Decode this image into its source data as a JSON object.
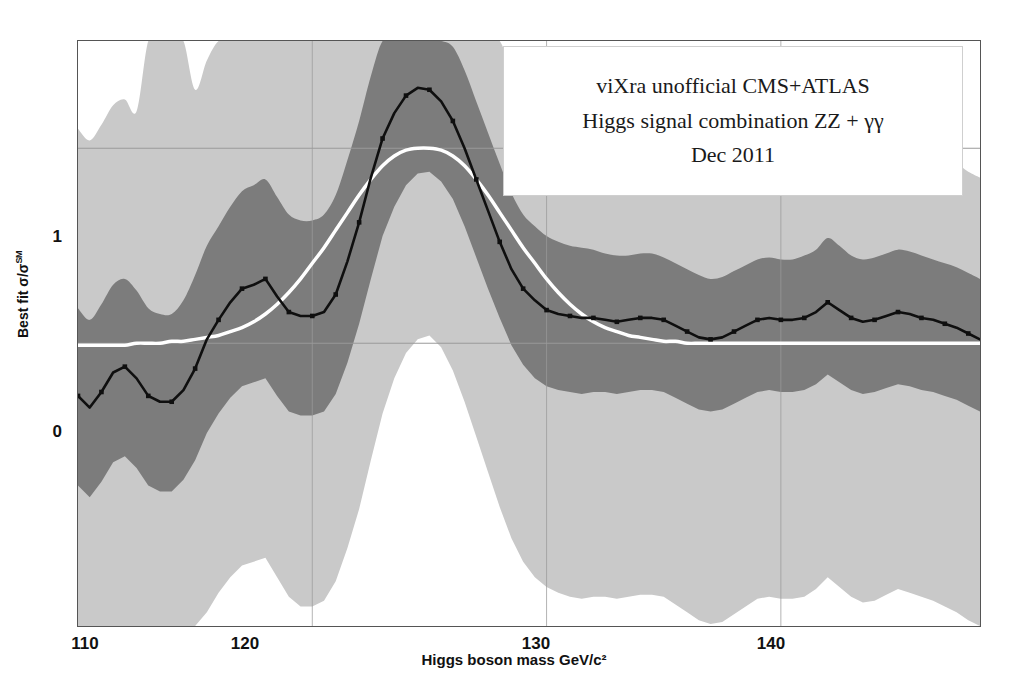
{
  "figure": {
    "background": "#ffffff",
    "frame_color": "#555555"
  },
  "legend": {
    "line1": "viXra unofficial CMS+ATLAS",
    "line2": "Higgs signal combination ZZ + γγ",
    "line3": "Dec 2011"
  },
  "axes": {
    "x_title": "Higgs boson mass GeV/c²",
    "y_title_prefix": "Best fit σ/σ",
    "y_title_sup": "SM",
    "x_ticks": [
      "110",
      "120",
      "130",
      "140"
    ],
    "y_ticks": [
      "1",
      "0"
    ]
  },
  "colors": {
    "band_2sigma": "#c9c9c9",
    "band_1sigma": "#7c7c7c",
    "best_fit_line": "#0f0f0f",
    "expected_curve": "#ffffff",
    "gridline": "#9a9a9a",
    "axis_text": "#111111"
  },
  "chart_data": {
    "type": "line",
    "subtitle": "Dec 2011",
    "xlabel": "Higgs boson mass GeV/c²",
    "ylabel": "Best fit σ/σSM",
    "xlim": [
      110,
      148.5
    ],
    "ylim": [
      -1.45,
      1.55
    ],
    "xticks": [
      110,
      120,
      130,
      140
    ],
    "yticks": [
      0,
      1
    ],
    "grid": "gridlines at y=0, y=1 and x=110,120,130,140",
    "legend_position": "top-right inside plot",
    "x": [
      110.0,
      110.5,
      111.0,
      111.5,
      112.0,
      112.5,
      113.0,
      113.5,
      114.0,
      114.5,
      115.0,
      115.5,
      116.0,
      116.5,
      117.0,
      117.5,
      118.0,
      118.5,
      119.0,
      119.5,
      120.0,
      120.5,
      121.0,
      121.5,
      122.0,
      122.5,
      123.0,
      123.5,
      124.0,
      124.5,
      125.0,
      125.5,
      126.0,
      126.5,
      127.0,
      127.5,
      128.0,
      128.5,
      129.0,
      129.5,
      130.0,
      130.5,
      131.0,
      131.5,
      132.0,
      132.5,
      133.0,
      133.5,
      134.0,
      134.5,
      135.0,
      135.5,
      136.0,
      136.5,
      137.0,
      137.5,
      138.0,
      138.5,
      139.0,
      139.5,
      140.0,
      140.5,
      141.0,
      141.5,
      142.0,
      142.5,
      143.0,
      143.5,
      144.0,
      144.5,
      145.0,
      145.5,
      146.0,
      146.5,
      147.0,
      147.5,
      148.0,
      148.5
    ],
    "series": [
      {
        "name": "Best fit σ/σSM (observed)",
        "style": "black line with square markers",
        "values": [
          -0.27,
          -0.33,
          -0.25,
          -0.15,
          -0.12,
          -0.18,
          -0.27,
          -0.3,
          -0.3,
          -0.24,
          -0.13,
          0.02,
          0.12,
          0.21,
          0.28,
          0.3,
          0.33,
          0.24,
          0.16,
          0.14,
          0.14,
          0.16,
          0.25,
          0.42,
          0.62,
          0.85,
          1.05,
          1.18,
          1.27,
          1.31,
          1.3,
          1.24,
          1.14,
          1.0,
          0.84,
          0.68,
          0.52,
          0.38,
          0.28,
          0.22,
          0.17,
          0.15,
          0.14,
          0.13,
          0.13,
          0.12,
          0.11,
          0.12,
          0.13,
          0.13,
          0.12,
          0.09,
          0.06,
          0.03,
          0.02,
          0.03,
          0.06,
          0.09,
          0.12,
          0.13,
          0.12,
          0.12,
          0.13,
          0.16,
          0.21,
          0.17,
          0.13,
          0.11,
          0.12,
          0.14,
          0.16,
          0.15,
          0.13,
          0.12,
          0.1,
          0.08,
          0.05,
          0.02
        ]
      },
      {
        "name": "Expected Standard Model signal",
        "style": "smooth white curve",
        "values": [
          -0.01,
          -0.01,
          -0.01,
          -0.01,
          -0.01,
          0.0,
          0.0,
          0.0,
          0.01,
          0.01,
          0.02,
          0.03,
          0.04,
          0.06,
          0.08,
          0.11,
          0.15,
          0.2,
          0.26,
          0.33,
          0.41,
          0.49,
          0.58,
          0.67,
          0.76,
          0.84,
          0.91,
          0.96,
          0.99,
          1.0,
          1.0,
          0.99,
          0.96,
          0.91,
          0.84,
          0.76,
          0.67,
          0.58,
          0.49,
          0.41,
          0.33,
          0.26,
          0.2,
          0.15,
          0.11,
          0.08,
          0.06,
          0.04,
          0.03,
          0.02,
          0.01,
          0.01,
          0.0,
          0.0,
          0.0,
          0.0,
          0.0,
          0.0,
          0.0,
          0.0,
          0.0,
          0.0,
          0.0,
          0.0,
          0.0,
          0.0,
          0.0,
          0.0,
          0.0,
          0.0,
          0.0,
          0.0,
          0.0,
          0.0,
          0.0,
          0.0,
          0.0,
          0.0
        ]
      }
    ],
    "bands": [
      {
        "name": "1 sigma band",
        "color": "#7c7c7c",
        "upper": [
          0.18,
          0.12,
          0.2,
          0.3,
          0.33,
          0.27,
          0.18,
          0.15,
          0.15,
          0.22,
          0.35,
          0.5,
          0.6,
          0.7,
          0.78,
          0.81,
          0.84,
          0.75,
          0.66,
          0.63,
          0.63,
          0.66,
          0.76,
          0.94,
          1.14,
          1.37,
          1.55,
          1.55,
          1.55,
          1.55,
          1.55,
          1.55,
          1.52,
          1.4,
          1.24,
          1.08,
          0.92,
          0.77,
          0.66,
          0.6,
          0.55,
          0.52,
          0.5,
          0.49,
          0.48,
          0.46,
          0.45,
          0.45,
          0.46,
          0.46,
          0.44,
          0.41,
          0.38,
          0.35,
          0.33,
          0.34,
          0.37,
          0.4,
          0.43,
          0.44,
          0.43,
          0.43,
          0.45,
          0.48,
          0.54,
          0.5,
          0.45,
          0.43,
          0.44,
          0.46,
          0.48,
          0.47,
          0.45,
          0.43,
          0.41,
          0.39,
          0.36,
          0.33
        ],
        "lower": [
          -0.73,
          -0.79,
          -0.71,
          -0.61,
          -0.58,
          -0.64,
          -0.73,
          -0.76,
          -0.76,
          -0.7,
          -0.6,
          -0.46,
          -0.36,
          -0.28,
          -0.22,
          -0.2,
          -0.18,
          -0.27,
          -0.35,
          -0.37,
          -0.37,
          -0.35,
          -0.26,
          -0.1,
          0.1,
          0.33,
          0.55,
          0.7,
          0.81,
          0.87,
          0.88,
          0.83,
          0.74,
          0.6,
          0.44,
          0.28,
          0.13,
          -0.01,
          -0.11,
          -0.18,
          -0.22,
          -0.24,
          -0.25,
          -0.26,
          -0.25,
          -0.25,
          -0.26,
          -0.25,
          -0.24,
          -0.24,
          -0.25,
          -0.28,
          -0.31,
          -0.34,
          -0.35,
          -0.34,
          -0.31,
          -0.28,
          -0.25,
          -0.24,
          -0.25,
          -0.25,
          -0.24,
          -0.21,
          -0.16,
          -0.2,
          -0.24,
          -0.26,
          -0.25,
          -0.23,
          -0.21,
          -0.22,
          -0.24,
          -0.25,
          -0.27,
          -0.29,
          -0.32,
          -0.35
        ]
      },
      {
        "name": "2 sigma band",
        "color": "#c9c9c9",
        "upper": [
          1.1,
          1.04,
          1.12,
          1.22,
          1.25,
          1.19,
          1.55,
          1.55,
          1.55,
          1.55,
          1.3,
          1.45,
          1.55,
          1.55,
          1.55,
          1.55,
          1.55,
          1.55,
          1.55,
          1.55,
          1.55,
          1.55,
          1.55,
          1.55,
          1.55,
          1.55,
          1.55,
          1.55,
          1.55,
          1.55,
          1.55,
          1.55,
          1.55,
          1.55,
          1.55,
          1.55,
          1.55,
          1.4,
          1.25,
          1.18,
          1.12,
          1.08,
          1.06,
          1.04,
          1.02,
          1.0,
          0.99,
          0.99,
          1.0,
          1.0,
          0.98,
          0.94,
          0.9,
          0.86,
          0.84,
          0.85,
          0.89,
          0.93,
          0.97,
          0.98,
          0.97,
          0.97,
          0.99,
          1.03,
          1.09,
          1.04,
          0.99,
          0.96,
          0.97,
          1.0,
          1.02,
          1.01,
          0.99,
          0.97,
          0.94,
          0.92,
          0.88,
          0.85
        ],
        "lower": [
          -1.45,
          -1.45,
          -1.45,
          -1.45,
          -1.45,
          -1.45,
          -1.45,
          -1.45,
          -1.45,
          -1.45,
          -1.45,
          -1.38,
          -1.28,
          -1.2,
          -1.14,
          -1.12,
          -1.1,
          -1.2,
          -1.3,
          -1.35,
          -1.35,
          -1.32,
          -1.22,
          -1.05,
          -0.85,
          -0.6,
          -0.36,
          -0.18,
          -0.05,
          0.02,
          0.04,
          -0.02,
          -0.14,
          -0.3,
          -0.48,
          -0.66,
          -0.84,
          -1.0,
          -1.12,
          -1.2,
          -1.25,
          -1.28,
          -1.3,
          -1.31,
          -1.3,
          -1.3,
          -1.31,
          -1.3,
          -1.29,
          -1.29,
          -1.3,
          -1.34,
          -1.38,
          -1.42,
          -1.44,
          -1.43,
          -1.39,
          -1.35,
          -1.31,
          -1.3,
          -1.31,
          -1.31,
          -1.3,
          -1.26,
          -1.2,
          -1.25,
          -1.3,
          -1.33,
          -1.32,
          -1.29,
          -1.26,
          -1.28,
          -1.3,
          -1.32,
          -1.35,
          -1.38,
          -1.42,
          -1.45
        ]
      }
    ]
  }
}
